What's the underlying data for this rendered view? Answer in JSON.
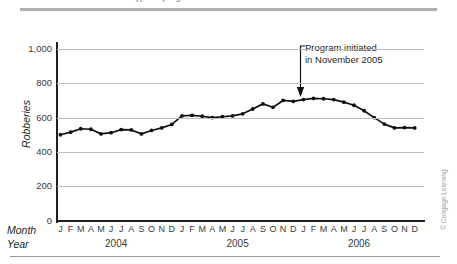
{
  "figure": {
    "top_cropped_caption": "type of program was initiated in November 2005",
    "credit": "© Cengage Learning"
  },
  "annotation": {
    "line1": "Program initiated",
    "line2": "in November 2005"
  },
  "axis_row_labels": {
    "month": "Month",
    "year": "Year"
  },
  "chart_data": {
    "type": "line",
    "title": "",
    "xlabel": "Month / Year",
    "ylabel": "Robberies",
    "ylim": [
      0,
      1000
    ],
    "ytick_labels": [
      "1,000",
      "800",
      "600",
      "400",
      "200",
      "0"
    ],
    "ytick_values": [
      1000,
      800,
      600,
      400,
      200,
      0
    ],
    "grid": true,
    "legend": "none",
    "month_labels": [
      "J",
      "F",
      "M",
      "A",
      "M",
      "J",
      "J",
      "A",
      "S",
      "O",
      "N",
      "D"
    ],
    "years": [
      "2004",
      "2005",
      "2006"
    ],
    "marker": "filled-circle",
    "line_color": "#111111",
    "grid_color": "#bdbdbd",
    "annotations": [
      {
        "text": "Program initiated in November 2005",
        "points_to_month": "Nov",
        "points_to_year": "2005",
        "points_to_value": 700
      }
    ],
    "x": [
      "2004-J",
      "2004-F",
      "2004-M",
      "2004-A",
      "2004-M",
      "2004-J",
      "2004-J",
      "2004-A",
      "2004-S",
      "2004-O",
      "2004-N",
      "2004-D",
      "2005-J",
      "2005-F",
      "2005-M",
      "2005-A",
      "2005-M",
      "2005-J",
      "2005-J",
      "2005-A",
      "2005-S",
      "2005-O",
      "2005-N",
      "2005-D",
      "2006-J",
      "2006-F",
      "2006-M",
      "2006-A",
      "2006-M",
      "2006-J",
      "2006-J",
      "2006-A",
      "2006-S",
      "2006-O",
      "2006-N",
      "2006-D"
    ],
    "values": [
      500,
      515,
      535,
      532,
      505,
      512,
      530,
      528,
      505,
      525,
      540,
      560,
      610,
      613,
      608,
      600,
      605,
      610,
      622,
      650,
      680,
      660,
      700,
      695,
      705,
      712,
      710,
      705,
      690,
      672,
      640,
      600,
      562,
      540,
      542,
      540
    ]
  }
}
